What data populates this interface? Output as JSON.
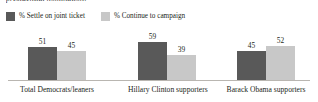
{
  "headline": {
    "text": "presidential nomination:"
  },
  "legend": {
    "position": "top-left",
    "items": [
      {
        "label": "% Settle on joint ticket",
        "color": "#595959",
        "swatch": "dark-swatch"
      },
      {
        "label": "% Continue to campaign",
        "color": "#c8c8c8",
        "swatch": "light-swatch"
      }
    ]
  },
  "chart_data": {
    "type": "bar",
    "title": "presidential nomination:",
    "xlabel": "",
    "ylabel": "",
    "ylim": [
      0,
      100
    ],
    "grid": false,
    "legend_position": "top-left",
    "categories": [
      "Total Democrats/leaners",
      "Hillary Clinton supporters",
      "Barack Obama supporters"
    ],
    "series": [
      {
        "name": "% Settle on joint ticket",
        "color": "#595959",
        "values": [
          51,
          59,
          45
        ]
      },
      {
        "name": "% Continue to campaign",
        "color": "#c8c8c8",
        "values": [
          45,
          39,
          52
        ]
      }
    ],
    "data_labels": [
      {
        "category": "Total Democrats/leaners",
        "settle": 51,
        "continue": 45
      },
      {
        "category": "Hillary Clinton supporters",
        "settle": 59,
        "continue": 39
      },
      {
        "category": "Barack Obama supporters",
        "settle": 45,
        "continue": 52
      }
    ]
  },
  "colors": {
    "series_dark": "#595959",
    "series_light": "#c8c8c8",
    "baseline": "#b9b6b1",
    "text": "#231f20",
    "background": "#ffffff"
  }
}
